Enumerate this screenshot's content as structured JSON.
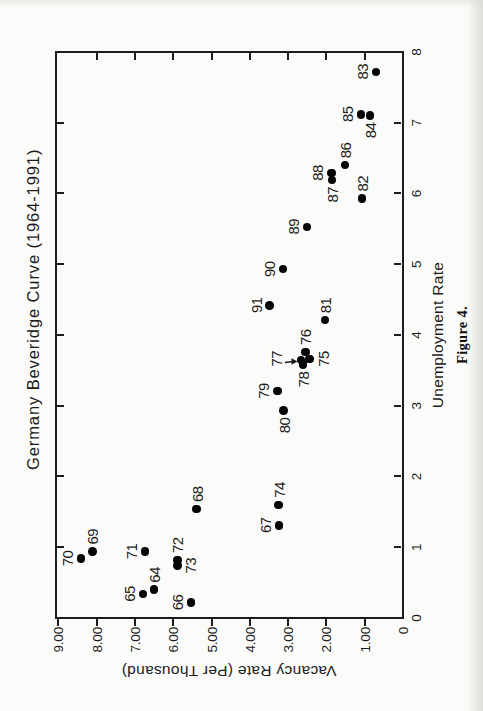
{
  "colors": {
    "ink": "#1c1c1c",
    "dot": "#050505",
    "paper": "#fbfbf9",
    "scan_shadow": "#dcdcd8"
  },
  "chart_data": {
    "type": "scatter",
    "title": "Germany Beveridge Curve (1964-1991)",
    "xlabel": "Unemployment Rate",
    "ylabel": "Vacancy Rate (Per Thousand)",
    "caption": "Figure 4.",
    "xlim": [
      0,
      8
    ],
    "ylim": [
      0,
      9.1
    ],
    "grid": false,
    "legend": "none",
    "layout": {
      "rotated_ccw_90_on_page": true,
      "frame": "closed-box",
      "ticks": "all-sides-at-integers",
      "point_marker": "filled-circle"
    },
    "x_ticks": [
      0,
      1,
      2,
      3,
      4,
      5,
      6,
      7,
      8
    ],
    "x_tick_labels": [
      "0",
      "1",
      "2",
      "3",
      "4",
      "5",
      "6",
      "7",
      "8"
    ],
    "y_ticks": [
      0,
      1,
      2,
      3,
      4,
      5,
      6,
      7,
      8,
      9
    ],
    "y_tick_labels": [
      "0",
      "1.00",
      "2.00",
      "3.00",
      "4.00",
      "5.00",
      "6.00",
      "7.00",
      "8.00",
      "9.00"
    ],
    "points": [
      {
        "year": "64",
        "x": 0.4,
        "y": 6.5,
        "label_side": "right"
      },
      {
        "year": "65",
        "x": 0.34,
        "y": 6.79,
        "label_side": "above"
      },
      {
        "year": "66",
        "x": 0.22,
        "y": 5.54,
        "label_side": "above"
      },
      {
        "year": "67",
        "x": 1.31,
        "y": 3.24,
        "label_side": "above"
      },
      {
        "year": "68",
        "x": 1.54,
        "y": 5.39,
        "label_side": "right"
      },
      {
        "year": "69",
        "x": 0.94,
        "y": 8.11,
        "label_side": "right"
      },
      {
        "year": "70",
        "x": 0.84,
        "y": 8.41,
        "label_side": "above"
      },
      {
        "year": "71",
        "x": 0.94,
        "y": 6.73,
        "label_side": "above"
      },
      {
        "year": "72",
        "x": 0.82,
        "y": 5.89,
        "label_side": "right"
      },
      {
        "year": "73",
        "x": 0.74,
        "y": 5.89,
        "label_side": "below"
      },
      {
        "year": "74",
        "x": 1.6,
        "y": 3.25,
        "label_side": "right"
      },
      {
        "year": "75",
        "x": 3.66,
        "y": 2.44,
        "label_side": "below"
      },
      {
        "year": "76",
        "x": 3.76,
        "y": 2.55,
        "label_side": "right"
      },
      {
        "year": "77",
        "x": 3.65,
        "y": 2.66,
        "label_side": "above-arrow"
      },
      {
        "year": "78",
        "x": 3.58,
        "y": 2.61,
        "label_side": "left"
      },
      {
        "year": "79",
        "x": 3.21,
        "y": 3.28,
        "label_side": "above"
      },
      {
        "year": "80",
        "x": 2.93,
        "y": 3.12,
        "label_side": "left"
      },
      {
        "year": "81",
        "x": 4.21,
        "y": 2.04,
        "label_side": "right"
      },
      {
        "year": "82",
        "x": 5.93,
        "y": 1.07,
        "label_side": "right"
      },
      {
        "year": "83",
        "x": 7.72,
        "y": 0.71,
        "label_side": "above"
      },
      {
        "year": "84",
        "x": 7.1,
        "y": 0.86,
        "label_side": "left"
      },
      {
        "year": "85",
        "x": 7.12,
        "y": 1.1,
        "label_side": "above"
      },
      {
        "year": "86",
        "x": 6.4,
        "y": 1.52,
        "label_side": "right"
      },
      {
        "year": "87",
        "x": 6.19,
        "y": 1.85,
        "label_side": "left"
      },
      {
        "year": "88",
        "x": 6.29,
        "y": 1.87,
        "label_side": "above"
      },
      {
        "year": "89",
        "x": 5.53,
        "y": 2.51,
        "label_side": "above"
      },
      {
        "year": "90",
        "x": 4.93,
        "y": 3.13,
        "label_side": "above"
      },
      {
        "year": "91",
        "x": 4.42,
        "y": 3.48,
        "label_side": "above"
      }
    ]
  }
}
